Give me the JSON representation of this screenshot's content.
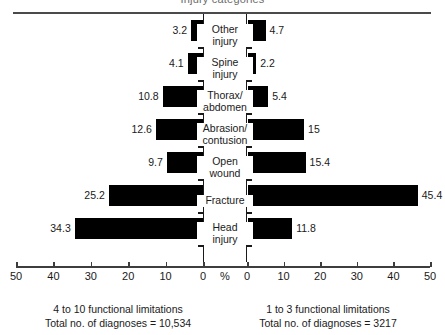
{
  "chart_data": {
    "type": "bar",
    "orientation": "horizontal",
    "style": "population-pyramid",
    "title": "Injury categories",
    "categories": [
      "Other\ninjury",
      "Spine\ninjury",
      "Thorax/\nabdomen",
      "Abrasion/\ncontusion",
      "Open\nwound",
      "Fracture",
      "Head\ninjury"
    ],
    "series": [
      {
        "name": "4 to 10 functional limitations",
        "side": "left",
        "values": [
          3.2,
          4.1,
          10.8,
          12.6,
          9.7,
          25.2,
          34.3
        ],
        "labels": [
          "3.2",
          "4.1",
          "10.8",
          "12.6",
          "9.7",
          "25.2",
          "34.3"
        ]
      },
      {
        "name": "1 to 3 functional limitations",
        "side": "right",
        "values": [
          4.7,
          2.2,
          5.4,
          15,
          15.4,
          45.4,
          11.8
        ],
        "labels": [
          "4.7",
          "2.2",
          "5.4",
          "15",
          "15.4",
          "45.4",
          "11.8"
        ]
      }
    ],
    "xlabel": "%",
    "ylabel": "",
    "xlim": [
      0,
      50
    ],
    "grid": false,
    "legend": "below",
    "axis_ticks_left": [
      "50",
      "40",
      "30",
      "20",
      "10",
      "0"
    ],
    "axis_center_label": "%",
    "axis_ticks_right": [
      "0",
      "10",
      "20",
      "30",
      "40",
      "50"
    ],
    "bar_color": "#000000"
  },
  "footers": {
    "left": {
      "line1": "4 to 10 functional limitations",
      "line2": "Total no. of diagnoses = 10,534"
    },
    "right": {
      "line1": "1 to 3 functional limitations",
      "line2": "Total no. of diagnoses = 3217"
    }
  }
}
